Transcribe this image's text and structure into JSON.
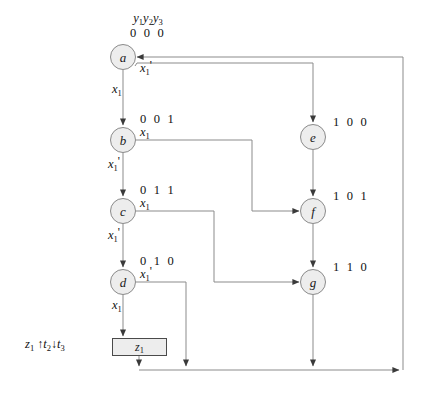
{
  "diagram": {
    "header": {
      "variables": "y1y2y3",
      "variables_display": "y₁y₂y₃",
      "root_code": "0 0 0"
    },
    "output_annotation": {
      "text": "z1 ↑t2↓t3",
      "signal": "z1",
      "up_arrow": "↑",
      "set_time": "t2",
      "down_arrow": "↓",
      "reset_time": "t3"
    },
    "output_box": {
      "label": "z1",
      "label_display": "z₁"
    },
    "nodes": [
      {
        "id": "a",
        "label": "a",
        "code": "0 0 0",
        "cx": 123,
        "cy": 57
      },
      {
        "id": "b",
        "label": "b",
        "code": "0 0 1",
        "cx": 123,
        "cy": 140
      },
      {
        "id": "c",
        "label": "c",
        "code": "0 1 1",
        "cx": 123,
        "cy": 211
      },
      {
        "id": "d",
        "label": "d",
        "code": "0 1 0",
        "cx": 123,
        "cy": 282
      },
      {
        "id": "e",
        "label": "e",
        "code": "1 0 0",
        "cx": 313,
        "cy": 137
      },
      {
        "id": "f",
        "label": "f",
        "code": "1 0 1",
        "cx": 313,
        "cy": 211
      },
      {
        "id": "g",
        "label": "g",
        "code": "1 1 0",
        "cx": 313,
        "cy": 282
      }
    ],
    "edge_labels": [
      {
        "from": "a",
        "condition": "x1'",
        "x": 140,
        "y": 64
      },
      {
        "from": "a",
        "condition": "x1",
        "x": 114,
        "y": 84
      },
      {
        "from": "b",
        "condition": "x1",
        "x": 140,
        "y": 128
      },
      {
        "from": "b",
        "condition": "x1'",
        "x": 110,
        "y": 160
      },
      {
        "from": "c",
        "condition": "x1",
        "x": 140,
        "y": 199
      },
      {
        "from": "c",
        "condition": "x1'",
        "x": 110,
        "y": 231
      },
      {
        "from": "d",
        "condition": "x1'",
        "x": 140,
        "y": 270
      },
      {
        "from": "d",
        "condition": "x1",
        "x": 114,
        "y": 300
      }
    ]
  }
}
